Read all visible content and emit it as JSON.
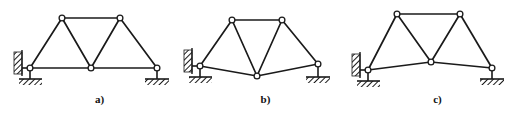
{
  "figure": {
    "background_color": "#ffffff",
    "line_color": "#1a1a1a",
    "node_fill_color": "#ffffff",
    "hatch_color": "#1a1a1a",
    "caption_color": "#111111",
    "panel_count": 3
  },
  "panels": [
    {
      "id": "a",
      "label": "a)",
      "description": "truss with straight horizontal bottom chord",
      "nodes": [
        {
          "name": "left-support-node",
          "x": 30,
          "y": 68
        },
        {
          "name": "top-left-node",
          "x": 62,
          "y": 18
        },
        {
          "name": "top-right-node",
          "x": 120,
          "y": 18
        },
        {
          "name": "bottom-center-node",
          "x": 91,
          "y": 68
        },
        {
          "name": "right-support-node",
          "x": 157,
          "y": 68
        }
      ],
      "members": [
        {
          "name": "top-chord",
          "from": "top-left-node",
          "to": "top-right-node"
        },
        {
          "name": "left-rafter",
          "from": "left-support-node",
          "to": "top-left-node"
        },
        {
          "name": "right-rafter",
          "from": "right-support-node",
          "to": "top-right-node"
        },
        {
          "name": "left-diagonal",
          "from": "top-left-node",
          "to": "bottom-center-node"
        },
        {
          "name": "right-diagonal",
          "from": "top-right-node",
          "to": "bottom-center-node"
        },
        {
          "name": "bottom-chord-left",
          "from": "left-support-node",
          "to": "bottom-center-node"
        },
        {
          "name": "bottom-chord-right",
          "from": "bottom-center-node",
          "to": "right-support-node"
        }
      ],
      "supports": [
        {
          "name": "wall-pin-support",
          "type": "wall-pin",
          "x": 30,
          "y": 68
        },
        {
          "name": "roller-support",
          "type": "pin-on-ground",
          "x": 157,
          "y": 68
        }
      ]
    },
    {
      "id": "b",
      "label": "b)",
      "description": "truss with bottom chord sagging down at the centre node",
      "nodes": [
        {
          "name": "left-support-node",
          "x": 30,
          "y": 66
        },
        {
          "name": "top-left-node",
          "x": 62,
          "y": 20
        },
        {
          "name": "top-right-node",
          "x": 112,
          "y": 20
        },
        {
          "name": "bottom-center-node",
          "x": 87,
          "y": 76
        },
        {
          "name": "right-support-node",
          "x": 148,
          "y": 64
        }
      ],
      "members": [
        {
          "name": "top-chord",
          "from": "top-left-node",
          "to": "top-right-node"
        },
        {
          "name": "left-rafter",
          "from": "left-support-node",
          "to": "top-left-node"
        },
        {
          "name": "right-rafter",
          "from": "right-support-node",
          "to": "top-right-node"
        },
        {
          "name": "left-diagonal",
          "from": "top-left-node",
          "to": "bottom-center-node"
        },
        {
          "name": "right-diagonal",
          "from": "top-right-node",
          "to": "bottom-center-node"
        },
        {
          "name": "bottom-chord-left",
          "from": "left-support-node",
          "to": "bottom-center-node"
        },
        {
          "name": "bottom-chord-right",
          "from": "bottom-center-node",
          "to": "right-support-node"
        }
      ],
      "supports": [
        {
          "name": "wall-pin-support",
          "type": "wall-pin",
          "x": 30,
          "y": 66
        },
        {
          "name": "roller-support",
          "type": "pin-on-ground",
          "x": 148,
          "y": 64
        }
      ]
    },
    {
      "id": "c",
      "label": "c)",
      "description": "truss with bottom chord arched upward at the centre node",
      "nodes": [
        {
          "name": "left-support-node",
          "x": 28,
          "y": 70
        },
        {
          "name": "top-left-node",
          "x": 57,
          "y": 14
        },
        {
          "name": "top-right-node",
          "x": 120,
          "y": 14
        },
        {
          "name": "bottom-center-node",
          "x": 91,
          "y": 62
        },
        {
          "name": "right-support-node",
          "x": 152,
          "y": 68
        }
      ],
      "members": [
        {
          "name": "top-chord",
          "from": "top-left-node",
          "to": "top-right-node"
        },
        {
          "name": "left-rafter",
          "from": "left-support-node",
          "to": "top-left-node"
        },
        {
          "name": "right-rafter",
          "from": "right-support-node",
          "to": "top-right-node"
        },
        {
          "name": "left-diagonal",
          "from": "top-left-node",
          "to": "bottom-center-node"
        },
        {
          "name": "right-diagonal",
          "from": "top-right-node",
          "to": "bottom-center-node"
        },
        {
          "name": "bottom-chord-left",
          "from": "left-support-node",
          "to": "bottom-center-node"
        },
        {
          "name": "bottom-chord-right",
          "from": "bottom-center-node",
          "to": "right-support-node"
        }
      ],
      "supports": [
        {
          "name": "wall-pin-support",
          "type": "wall-pin",
          "x": 28,
          "y": 70
        },
        {
          "name": "roller-support",
          "type": "pin-on-ground",
          "x": 152,
          "y": 68
        }
      ]
    }
  ]
}
